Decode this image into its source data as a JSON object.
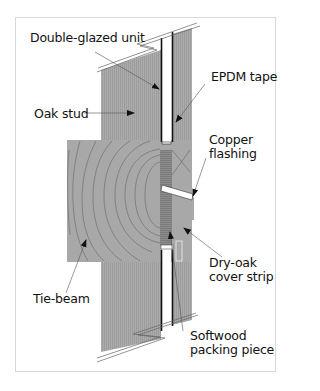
{
  "diagram": {
    "type": "construction-section",
    "labels": {
      "double_glazed_unit": "Double-glazed unit",
      "epdm_tape": "EPDM tape",
      "oak_stud": "Oak stud",
      "copper_flashing_1": "Copper",
      "copper_flashing_2": "flashing",
      "dry_oak_1": "Dry-oak",
      "dry_oak_2": "cover strip",
      "tie_beam": "Tie-beam",
      "softwood_1": "Softwood",
      "softwood_2": "packing piece"
    },
    "colors": {
      "timber": "#a9a9a9",
      "timber_dark": "#8e8e8e",
      "grain": "#6e6e6e",
      "glass": "#ffffff",
      "line": "#111111",
      "frame_border": "#d8d8d8"
    }
  }
}
